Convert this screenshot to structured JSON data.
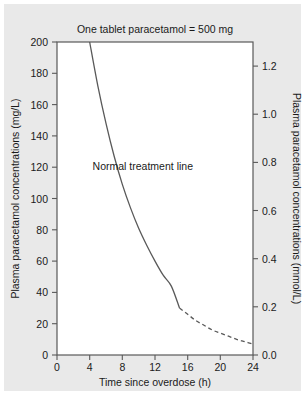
{
  "chart_data": {
    "type": "line",
    "title": "One tablet paracetamol = 500 mg",
    "xlabel": "Time since overdose (h)",
    "ylabel": "Plasma paracetamol concentrations (mg/L)",
    "ylabel_right": "Plasma paracetamol concentrations (mmol/L)",
    "xlim": [
      0,
      24
    ],
    "ylim": [
      0,
      200
    ],
    "ylim_right": [
      0.0,
      1.3
    ],
    "grid": false,
    "legend": false,
    "xticks": [
      0,
      4,
      8,
      12,
      16,
      20,
      24
    ],
    "xticklabels": [
      "0",
      "4",
      "8",
      "12",
      "16",
      "20",
      "24"
    ],
    "yticks": [
      0,
      20,
      40,
      60,
      80,
      100,
      120,
      140,
      160,
      180,
      200
    ],
    "yticklabels": [
      "0",
      "20",
      "40",
      "60",
      "80",
      "100",
      "120",
      "140",
      "160",
      "180",
      "200"
    ],
    "yticks_right": [
      0.0,
      0.2,
      0.4,
      0.6,
      0.8,
      1.0,
      1.2
    ],
    "yticklabels_right": [
      "0.0",
      "0.2",
      "0.4",
      "0.6",
      "0.8",
      "1.0",
      "1.2"
    ],
    "annotations": [
      {
        "text": "Normal treatment line",
        "x": 10.5,
        "y": 118
      }
    ],
    "series": [
      {
        "name": "Normal treatment line",
        "style": "solid",
        "color": "#595959",
        "x": [
          4.0,
          5.0,
          6.0,
          7.0,
          8.0,
          9.0,
          10.0,
          11.0,
          12.0,
          13.0,
          14.0,
          15.0
        ],
        "y": [
          200,
          172,
          148,
          127,
          109,
          94,
          81,
          70,
          60,
          51,
          44,
          30
        ]
      },
      {
        "name": "Normal treatment line (extrapolated)",
        "style": "dashed",
        "color": "#595959",
        "x": [
          15.0,
          16.0,
          17.0,
          18.0,
          19.0,
          20.0,
          21.0,
          22.0,
          23.0,
          24.0
        ],
        "y": [
          30,
          26,
          22,
          19,
          16,
          14,
          12,
          10,
          8.5,
          7
        ]
      }
    ]
  }
}
